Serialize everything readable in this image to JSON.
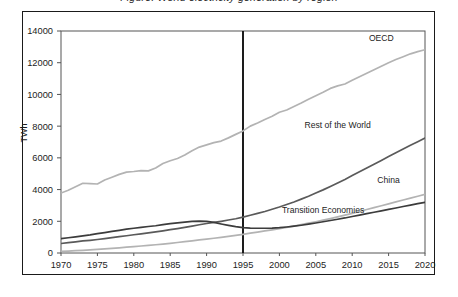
{
  "figure": {
    "title_partial": "Figure: World electricity generation by region",
    "ylabel": "TWh"
  },
  "chart_data": {
    "type": "line",
    "title": "Figure: World electricity generation by region",
    "xlabel": "",
    "ylabel": "TWh",
    "xlim": [
      1970,
      2020
    ],
    "ylim": [
      0,
      14000
    ],
    "grid": false,
    "legend_position": "inline-right-labels",
    "xticks": [
      1970,
      1975,
      1980,
      1985,
      1990,
      1995,
      2000,
      2005,
      2010,
      2015,
      2020
    ],
    "yticks": [
      0,
      2000,
      4000,
      6000,
      8000,
      10000,
      12000,
      14000
    ],
    "annotations": [
      {
        "name": "history-projection-divider",
        "type": "vline",
        "x": 1995
      }
    ],
    "x": [
      1970,
      1971,
      1972,
      1973,
      1974,
      1975,
      1976,
      1977,
      1978,
      1979,
      1980,
      1981,
      1982,
      1983,
      1984,
      1985,
      1986,
      1987,
      1988,
      1989,
      1990,
      1991,
      1992,
      1993,
      1994,
      1995,
      1996,
      1997,
      1998,
      1999,
      2000,
      2001,
      2002,
      2003,
      2004,
      2005,
      2006,
      2007,
      2008,
      2009,
      2010,
      2011,
      2012,
      2013,
      2014,
      2015,
      2016,
      2017,
      2018,
      2019,
      2020
    ],
    "series": [
      {
        "name": "OECD",
        "color": "#b3b3b3",
        "values": [
          3780,
          3960,
          4180,
          4400,
          4380,
          4350,
          4600,
          4780,
          4960,
          5100,
          5140,
          5200,
          5180,
          5360,
          5640,
          5820,
          5960,
          6180,
          6450,
          6680,
          6820,
          6960,
          7060,
          7260,
          7480,
          7700,
          8000,
          8200,
          8420,
          8620,
          8880,
          9020,
          9240,
          9460,
          9700,
          9920,
          10140,
          10380,
          10540,
          10660,
          10900,
          11120,
          11340,
          11560,
          11780,
          12000,
          12200,
          12380,
          12560,
          12700,
          12820
        ]
      },
      {
        "name": "Rest of the World",
        "color": "#5a5a5a",
        "values": [
          600,
          650,
          700,
          760,
          800,
          850,
          910,
          970,
          1030,
          1090,
          1150,
          1210,
          1270,
          1330,
          1400,
          1470,
          1540,
          1620,
          1700,
          1780,
          1860,
          1930,
          2000,
          2080,
          2160,
          2260,
          2380,
          2500,
          2620,
          2760,
          2900,
          3060,
          3220,
          3400,
          3580,
          3780,
          3980,
          4200,
          4420,
          4640,
          4880,
          5120,
          5360,
          5600,
          5840,
          6080,
          6320,
          6560,
          6800,
          7020,
          7250
        ]
      },
      {
        "name": "China",
        "color": "#b3b3b3",
        "values": [
          100,
          120,
          145,
          170,
          195,
          225,
          255,
          290,
          325,
          365,
          405,
          440,
          480,
          520,
          565,
          610,
          660,
          715,
          770,
          825,
          880,
          930,
          985,
          1045,
          1110,
          1180,
          1250,
          1320,
          1390,
          1460,
          1540,
          1620,
          1700,
          1790,
          1880,
          1970,
          2070,
          2170,
          2280,
          2390,
          2500,
          2620,
          2740,
          2860,
          2980,
          3100,
          3220,
          3340,
          3460,
          3580,
          3700
        ]
      },
      {
        "name": "Transition Economies",
        "color": "#3c3c3c",
        "values": [
          900,
          960,
          1020,
          1080,
          1140,
          1220,
          1290,
          1360,
          1430,
          1500,
          1560,
          1620,
          1670,
          1720,
          1790,
          1850,
          1900,
          1950,
          1990,
          2010,
          2000,
          1930,
          1830,
          1740,
          1660,
          1600,
          1570,
          1560,
          1560,
          1570,
          1600,
          1640,
          1690,
          1750,
          1820,
          1890,
          1970,
          2050,
          2130,
          2210,
          2300,
          2390,
          2480,
          2570,
          2660,
          2750,
          2840,
          2930,
          3020,
          3110,
          3200
        ]
      }
    ],
    "series_labels": [
      {
        "name": "OECD",
        "x": 2014,
        "y": 13400
      },
      {
        "name": "Rest of the World",
        "x": 2008,
        "y": 7900
      },
      {
        "name": "China",
        "x": 2015,
        "y": 4400
      },
      {
        "name": "Transition Economies",
        "x": 2006,
        "y": 2500
      }
    ]
  }
}
